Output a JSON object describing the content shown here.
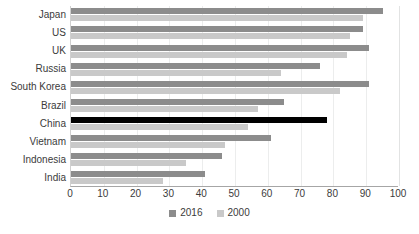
{
  "chart_data": {
    "type": "bar",
    "orientation": "horizontal",
    "title": "",
    "xlabel": "",
    "ylabel": "",
    "xlim": [
      0,
      100
    ],
    "xticks": [
      0,
      10,
      20,
      30,
      40,
      50,
      60,
      70,
      80,
      90,
      100
    ],
    "grid": true,
    "legend_position": "bottom",
    "categories": [
      "Japan",
      "US",
      "UK",
      "Russia",
      "South Korea",
      "Brazil",
      "China",
      "Vietnam",
      "Indonesia",
      "India"
    ],
    "series": [
      {
        "name": "2016",
        "color": "#8c8c8c",
        "highlight_color": "#000000",
        "highlight_category": "China",
        "values": [
          95,
          89,
          91,
          76,
          91,
          65,
          78,
          61,
          46,
          41
        ]
      },
      {
        "name": "2000",
        "color": "#c9c9c9",
        "values": [
          89,
          85,
          84,
          64,
          82,
          57,
          54,
          47,
          35,
          28
        ]
      }
    ]
  },
  "legend": {
    "items": [
      {
        "label": "2016",
        "color": "#8c8c8c"
      },
      {
        "label": "2000",
        "color": "#c9c9c9"
      }
    ]
  },
  "axis": {
    "tick_labels": [
      "0",
      "10",
      "20",
      "30",
      "40",
      "50",
      "60",
      "70",
      "80",
      "90",
      "100"
    ]
  }
}
